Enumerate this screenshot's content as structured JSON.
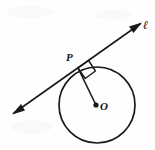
{
  "figure": {
    "width": 155,
    "height": 150,
    "background_color": "#fefefe",
    "ink_color": "#191919"
  },
  "labels": {
    "tangent_point": "P",
    "center": "O",
    "line": "ℓ"
  },
  "geometry": {
    "circle": {
      "cx": 97,
      "cy": 105,
      "r": 38
    },
    "center_dot": {
      "cx": 96,
      "cy": 105,
      "r": 2.6
    },
    "tangent_point": {
      "x": 78,
      "y": 68
    },
    "tangent_line": {
      "x1": 14,
      "y1": 113,
      "x2": 140,
      "y2": 24
    },
    "radius_segment": {
      "x1": 78,
      "y1": 68,
      "x2": 96,
      "y2": 105
    },
    "right_angle_marker_size": 11,
    "arrow_head_length": 9,
    "arrow_head_width": 5
  },
  "annotations": {
    "right_angle": "90°",
    "relationship": "radius OP is perpendicular to tangent line ℓ at P"
  }
}
